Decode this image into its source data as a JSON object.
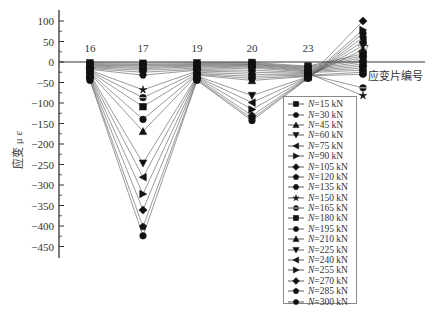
{
  "chart_data": {
    "type": "line",
    "title": "",
    "xlabel": "应变片编号",
    "ylabel": "应变 μ ε",
    "ylim": [
      -480,
      120
    ],
    "yticks": [
      100,
      50,
      0,
      -50,
      -100,
      -150,
      -200,
      -250,
      -300,
      -350,
      -400,
      -450
    ],
    "categories": [
      "16",
      "17",
      "19",
      "20",
      "23",
      "27"
    ],
    "grid": false,
    "legend_position": "right-inside",
    "series": [
      {
        "name": "N=15 kN",
        "marker": "square",
        "values": [
          -2,
          -3,
          -2,
          -1,
          -10,
          20
        ]
      },
      {
        "name": "N=30 kN",
        "marker": "circle",
        "values": [
          -4,
          -6,
          -4,
          -3,
          -12,
          15
        ]
      },
      {
        "name": "N=45 kN",
        "marker": "triangle-up",
        "values": [
          -6,
          -8,
          -6,
          -5,
          -14,
          10
        ]
      },
      {
        "name": "N=60 kN",
        "marker": "triangle-down",
        "values": [
          -8,
          -10,
          -8,
          -6,
          -16,
          5
        ]
      },
      {
        "name": "N=75 kN",
        "marker": "triangle-left",
        "values": [
          -10,
          -13,
          -10,
          -8,
          -18,
          0
        ]
      },
      {
        "name": "N=90 kN",
        "marker": "triangle-right",
        "values": [
          -12,
          -16,
          -12,
          -10,
          -20,
          -5
        ]
      },
      {
        "name": "N=105 kN",
        "marker": "diamond",
        "values": [
          -14,
          -20,
          -15,
          -12,
          -22,
          -10
        ]
      },
      {
        "name": "N=120 kN",
        "marker": "pentagon",
        "values": [
          -16,
          -25,
          -18,
          -15,
          -24,
          -15
        ]
      },
      {
        "name": "N=135 kN",
        "marker": "hexagon",
        "values": [
          -18,
          -32,
          -20,
          -20,
          -26,
          -20
        ]
      },
      {
        "name": "N=150 kN",
        "marker": "star",
        "values": [
          -20,
          -68,
          -22,
          -25,
          -28,
          -82
        ]
      },
      {
        "name": "N=165 kN",
        "marker": "circle-cross",
        "values": [
          -22,
          -87,
          -25,
          -30,
          -30,
          -63
        ]
      },
      {
        "name": "N=180 kN",
        "marker": "square",
        "values": [
          -24,
          -109,
          -28,
          -35,
          -32,
          -25
        ]
      },
      {
        "name": "N=195 kN",
        "marker": "circle",
        "values": [
          -26,
          -140,
          -30,
          -40,
          -34,
          -30
        ]
      },
      {
        "name": "N=210 kN",
        "marker": "triangle-up",
        "values": [
          -28,
          -169,
          -32,
          -45,
          -35,
          30
        ]
      },
      {
        "name": "N=225 kN",
        "marker": "triangle-down",
        "values": [
          -30,
          -247,
          -34,
          -82,
          -36,
          40
        ]
      },
      {
        "name": "N=240 kN",
        "marker": "triangle-left",
        "values": [
          -33,
          -281,
          -36,
          -99,
          -37,
          50
        ]
      },
      {
        "name": "N=255 kN",
        "marker": "triangle-right",
        "values": [
          -36,
          -322,
          -38,
          -116,
          -38,
          78
        ]
      },
      {
        "name": "N=270 kN",
        "marker": "diamond",
        "values": [
          -39,
          -361,
          -40,
          -131,
          -38,
          100
        ]
      },
      {
        "name": "N=285 kN",
        "marker": "pentagon",
        "values": [
          -42,
          -402,
          -43,
          -138,
          -39,
          60
        ]
      },
      {
        "name": "N=300 kN",
        "marker": "circle",
        "values": [
          -45,
          -424,
          -45,
          -143,
          -40,
          70
        ]
      }
    ]
  },
  "axis": {
    "y_title": "应变 μ ε",
    "x_title": "应变片编号"
  },
  "legend": {
    "items": [
      "=15 kN",
      "=30 kN",
      "=45 kN",
      "=60 kN",
      "=75 kN",
      "=90 kN",
      "=105 kN",
      "=120 kN",
      "=135 kN",
      "=150 kN",
      "=165 kN",
      "=180 kN",
      "=195 kN",
      "=210 kN",
      "=225 kN",
      "=240 kN",
      "=255 kN",
      "=270 kN",
      "=285 kN",
      "=300 kN"
    ],
    "prefix": "N"
  }
}
